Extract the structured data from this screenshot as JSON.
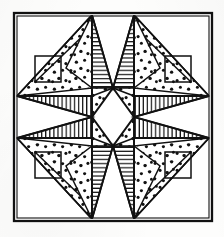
{
  "artwork": {
    "title": "Eight-Pointed Star Quilt Block",
    "alt_title": "LeMoyne Star patchwork pattern line drawing",
    "medium": "pen-and-ink line drawing",
    "background_color": "#fdfdfc",
    "ink_color": "#111111",
    "fill_color": "#ffffff",
    "symmetry": "4-fold mirror (horizontal and vertical axes)",
    "canvas": {
      "width": 224,
      "height": 237
    }
  },
  "frame": {
    "name": "outer border",
    "x": 14,
    "y": 13,
    "width": 198,
    "height": 208,
    "stroke_width": 2.2,
    "inner_offset": 2.5
  },
  "geometry": {
    "center": {
      "x": 113,
      "y": 117
    },
    "star_inner_top": {
      "x": 113,
      "y": 88
    },
    "star_inner_bottom": {
      "x": 113,
      "y": 146
    },
    "star_inner_left": {
      "x": 92,
      "y": 117
    },
    "star_inner_right": {
      "x": 133,
      "y": 117
    },
    "diamond_half_width": 21,
    "diamond_half_height": 29,
    "apex_top_left": {
      "x": 92,
      "y": 15
    },
    "apex_top_right": {
      "x": 133,
      "y": 15
    },
    "apex_bottom_left": {
      "x": 92,
      "y": 219
    },
    "apex_bottom_right": {
      "x": 133,
      "y": 219
    },
    "apex_left_top": {
      "x": 16,
      "y": 96
    },
    "apex_left_bottom": {
      "x": 16,
      "y": 138
    },
    "apex_right_top": {
      "x": 210,
      "y": 96
    },
    "apex_right_bottom": {
      "x": 210,
      "y": 138
    }
  },
  "legend": {
    "fabrics": [
      {
        "key": "dotted",
        "label": "dotted calico print",
        "render": "scattered round dots"
      },
      {
        "key": "horizontal",
        "label": "horizontal stripe",
        "render": "horizontal hatch lines"
      },
      {
        "key": "vertical",
        "label": "vertical stripe",
        "render": "vertical hatch lines"
      },
      {
        "key": "plain",
        "label": "plain white solid",
        "render": "unfilled white"
      }
    ]
  },
  "blocks": [
    {
      "name": "center-diamond",
      "fabric": "plain"
    },
    {
      "name": "star-point-north-west-half",
      "fabric": "dotted"
    },
    {
      "name": "star-point-north-east-half",
      "fabric": "horizontal"
    },
    {
      "name": "star-point-east-north-half",
      "fabric": "vertical"
    },
    {
      "name": "star-point-east-south-half",
      "fabric": "vertical"
    },
    {
      "name": "star-point-south-east-half",
      "fabric": "dotted"
    },
    {
      "name": "star-point-south-west-half",
      "fabric": "horizontal"
    },
    {
      "name": "star-point-west-north-half",
      "fabric": "vertical"
    },
    {
      "name": "star-point-west-south-half",
      "fabric": "vertical"
    },
    {
      "name": "corner-triangle-top-left",
      "fabric": "dotted"
    },
    {
      "name": "corner-triangle-top-right",
      "fabric": "dotted"
    },
    {
      "name": "corner-triangle-bottom-left",
      "fabric": "dotted"
    },
    {
      "name": "corner-triangle-bottom-right",
      "fabric": "dotted"
    },
    {
      "name": "inner-square-top-left",
      "fabric": "plain-outline"
    },
    {
      "name": "inner-square-top-right",
      "fabric": "plain-outline"
    },
    {
      "name": "inner-square-bottom-left",
      "fabric": "plain-outline"
    },
    {
      "name": "inner-square-bottom-right",
      "fabric": "plain-outline"
    },
    {
      "name": "side-wedge-left",
      "fabric": "plain"
    },
    {
      "name": "side-wedge-right",
      "fabric": "plain"
    }
  ]
}
